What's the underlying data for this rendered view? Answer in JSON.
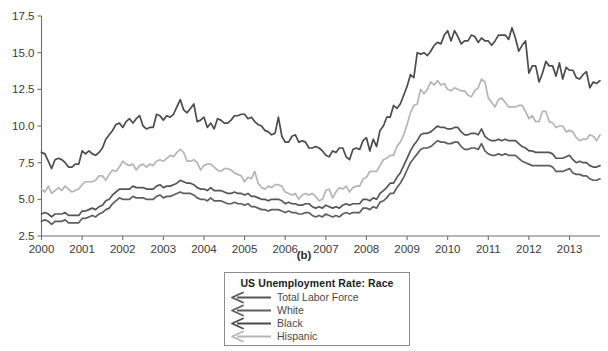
{
  "figure": {
    "panel_label": "(b)"
  },
  "legend": {
    "title": "US Unemployment Rate: Race",
    "marker_icon": "left-arrow-line-icon",
    "entries": [
      {
        "label": "Total Labor Force",
        "color": "#555555"
      },
      {
        "label": "White",
        "color": "#5e5e5e"
      },
      {
        "label": "Black",
        "color": "#4b4b4b"
      },
      {
        "label": "Hispanic",
        "color": "#b5b5b5"
      }
    ]
  },
  "chart_data": {
    "type": "line",
    "title": "US Unemployment Rate: Race",
    "xlabel": "",
    "ylabel": "",
    "xlim": [
      2000.0,
      2013.75
    ],
    "ylim": [
      2.5,
      17.5
    ],
    "grid": false,
    "legend_position": "below-center",
    "xticks": [
      "2000",
      "2001",
      "2002",
      "2003",
      "2004",
      "2005",
      "2006",
      "2007",
      "2008",
      "2009",
      "2010",
      "2011",
      "2012",
      "2013"
    ],
    "xtick_values": [
      2000,
      2001,
      2002,
      2003,
      2004,
      2005,
      2006,
      2007,
      2008,
      2009,
      2010,
      2011,
      2012,
      2013
    ],
    "yticks": [
      "2.5",
      "5.0",
      "7.5",
      "10.0",
      "12.5",
      "15.0",
      "17.5"
    ],
    "ytick_values": [
      2.5,
      5.0,
      7.5,
      10.0,
      12.5,
      15.0,
      17.5
    ],
    "x": [
      2000.0,
      2000.083,
      2000.167,
      2000.25,
      2000.333,
      2000.417,
      2000.5,
      2000.583,
      2000.667,
      2000.75,
      2000.833,
      2000.917,
      2001.0,
      2001.083,
      2001.167,
      2001.25,
      2001.333,
      2001.417,
      2001.5,
      2001.583,
      2001.667,
      2001.75,
      2001.833,
      2001.917,
      2002.0,
      2002.083,
      2002.167,
      2002.25,
      2002.333,
      2002.417,
      2002.5,
      2002.583,
      2002.667,
      2002.75,
      2002.833,
      2002.917,
      2003.0,
      2003.083,
      2003.167,
      2003.25,
      2003.333,
      2003.417,
      2003.5,
      2003.583,
      2003.667,
      2003.75,
      2003.833,
      2003.917,
      2004.0,
      2004.083,
      2004.167,
      2004.25,
      2004.333,
      2004.417,
      2004.5,
      2004.583,
      2004.667,
      2004.75,
      2004.833,
      2004.917,
      2005.0,
      2005.083,
      2005.167,
      2005.25,
      2005.333,
      2005.417,
      2005.5,
      2005.583,
      2005.667,
      2005.75,
      2005.833,
      2005.917,
      2006.0,
      2006.083,
      2006.167,
      2006.25,
      2006.333,
      2006.417,
      2006.5,
      2006.583,
      2006.667,
      2006.75,
      2006.833,
      2006.917,
      2007.0,
      2007.083,
      2007.167,
      2007.25,
      2007.333,
      2007.417,
      2007.5,
      2007.583,
      2007.667,
      2007.75,
      2007.833,
      2007.917,
      2008.0,
      2008.083,
      2008.167,
      2008.25,
      2008.333,
      2008.417,
      2008.5,
      2008.583,
      2008.667,
      2008.75,
      2008.833,
      2008.917,
      2009.0,
      2009.083,
      2009.167,
      2009.25,
      2009.333,
      2009.417,
      2009.5,
      2009.583,
      2009.667,
      2009.75,
      2009.833,
      2009.917,
      2010.0,
      2010.083,
      2010.167,
      2010.25,
      2010.333,
      2010.417,
      2010.5,
      2010.583,
      2010.667,
      2010.75,
      2010.833,
      2010.917,
      2011.0,
      2011.083,
      2011.167,
      2011.25,
      2011.333,
      2011.417,
      2011.5,
      2011.583,
      2011.667,
      2011.75,
      2011.833,
      2011.917,
      2012.0,
      2012.083,
      2012.167,
      2012.25,
      2012.333,
      2012.417,
      2012.5,
      2012.583,
      2012.667,
      2012.75,
      2012.833,
      2012.917,
      2013.0,
      2013.083,
      2013.167,
      2013.25,
      2013.333,
      2013.417,
      2013.5,
      2013.583,
      2013.667,
      2013.75
    ],
    "series": [
      {
        "name": "Black",
        "color": "#4b4b4b",
        "values": [
          8.2,
          8.1,
          7.6,
          7.1,
          7.7,
          7.8,
          7.7,
          7.5,
          7.2,
          7.2,
          7.4,
          7.4,
          8.3,
          8.1,
          8.3,
          8.1,
          8.0,
          8.2,
          8.5,
          9.1,
          9.4,
          9.7,
          10.1,
          10.2,
          9.9,
          10.3,
          10.5,
          10.2,
          10.5,
          10.7,
          10.0,
          9.8,
          9.9,
          9.9,
          10.8,
          10.7,
          10.4,
          10.7,
          10.6,
          10.8,
          11.3,
          11.8,
          11.1,
          10.9,
          11.2,
          11.5,
          10.3,
          10.4,
          10.6,
          9.9,
          10.2,
          9.8,
          10.5,
          10.4,
          10.2,
          10.2,
          10.4,
          10.7,
          10.7,
          10.8,
          10.8,
          10.5,
          10.6,
          10.3,
          10.1,
          10.0,
          9.7,
          9.6,
          9.4,
          9.5,
          10.6,
          9.3,
          8.9,
          8.9,
          9.3,
          9.4,
          8.9,
          9.0,
          8.9,
          8.5,
          8.5,
          8.6,
          8.5,
          8.3,
          8.0,
          7.9,
          8.3,
          8.2,
          8.5,
          8.5,
          7.9,
          7.7,
          8.4,
          8.5,
          8.4,
          9.0,
          9.2,
          8.3,
          9.1,
          8.6,
          9.7,
          10.0,
          10.6,
          10.6,
          11.4,
          11.2,
          11.5,
          12.1,
          12.7,
          13.5,
          13.3,
          15.0,
          14.9,
          15.0,
          14.8,
          15.1,
          15.5,
          15.7,
          15.6,
          16.2,
          16.5,
          15.8,
          16.5,
          16.1,
          15.6,
          15.8,
          15.8,
          16.2,
          16.1,
          15.7,
          16.0,
          15.8,
          15.8,
          15.5,
          15.8,
          16.2,
          16.2,
          16.2,
          15.9,
          16.7,
          16.0,
          15.1,
          15.5,
          15.8,
          13.6,
          14.1,
          14.1,
          13.0,
          13.6,
          14.4,
          14.1,
          14.1,
          13.4,
          14.3,
          13.2,
          14.0,
          13.8,
          13.8,
          13.3,
          13.2,
          13.5,
          13.7,
          12.6,
          13.0,
          12.9,
          13.1
        ]
      },
      {
        "name": "Hispanic",
        "color": "#b5b5b5",
        "values": [
          5.7,
          5.5,
          5.9,
          5.4,
          5.6,
          5.8,
          5.6,
          5.9,
          5.7,
          5.5,
          5.6,
          5.7,
          6.0,
          6.2,
          6.2,
          6.2,
          6.3,
          6.6,
          6.6,
          6.3,
          6.7,
          7.0,
          6.9,
          7.2,
          7.6,
          7.4,
          7.3,
          7.4,
          7.0,
          7.3,
          7.4,
          7.2,
          7.4,
          7.3,
          7.6,
          7.7,
          7.6,
          7.8,
          8.0,
          7.9,
          8.2,
          8.4,
          8.2,
          7.6,
          7.6,
          7.7,
          7.5,
          7.0,
          7.3,
          7.4,
          7.4,
          7.2,
          7.0,
          6.9,
          7.1,
          7.1,
          7.0,
          6.8,
          6.7,
          6.6,
          6.2,
          6.5,
          6.4,
          6.9,
          6.1,
          5.8,
          5.7,
          5.9,
          5.8,
          6.0,
          6.0,
          5.9,
          5.5,
          5.4,
          5.3,
          5.4,
          5.0,
          5.3,
          5.4,
          5.3,
          5.4,
          5.2,
          4.9,
          5.0,
          5.6,
          5.7,
          5.1,
          5.5,
          5.8,
          5.7,
          5.9,
          5.5,
          5.8,
          5.9,
          5.9,
          6.4,
          6.5,
          6.9,
          6.9,
          6.9,
          7.3,
          7.7,
          7.8,
          8.0,
          8.0,
          8.6,
          8.9,
          9.4,
          10.1,
          10.9,
          11.4,
          11.5,
          12.5,
          12.2,
          12.5,
          13.0,
          12.8,
          13.1,
          12.8,
          12.9,
          12.5,
          12.4,
          12.6,
          12.5,
          12.4,
          12.4,
          12.1,
          12.0,
          12.4,
          12.6,
          13.2,
          13.0,
          11.9,
          11.6,
          11.3,
          11.8,
          11.9,
          11.6,
          11.3,
          11.3,
          11.3,
          11.4,
          11.4,
          11.0,
          10.5,
          10.7,
          10.3,
          10.3,
          11.0,
          11.0,
          10.3,
          10.2,
          9.9,
          10.0,
          10.0,
          9.6,
          9.7,
          9.6,
          9.2,
          9.0,
          9.1,
          9.1,
          9.4,
          9.3,
          9.0,
          9.4
        ]
      },
      {
        "name": "Total Labor Force",
        "color": "#555555",
        "values": [
          4.0,
          4.1,
          4.0,
          3.8,
          4.0,
          4.0,
          4.0,
          4.1,
          3.9,
          3.9,
          3.9,
          3.9,
          4.2,
          4.2,
          4.3,
          4.4,
          4.3,
          4.5,
          4.6,
          4.9,
          5.0,
          5.3,
          5.5,
          5.7,
          5.7,
          5.7,
          5.7,
          5.9,
          5.8,
          5.8,
          5.8,
          5.7,
          5.7,
          5.7,
          5.9,
          6.0,
          5.8,
          5.9,
          5.9,
          6.0,
          6.1,
          6.3,
          6.2,
          6.1,
          6.1,
          6.0,
          5.8,
          5.7,
          5.7,
          5.6,
          5.8,
          5.6,
          5.6,
          5.6,
          5.5,
          5.4,
          5.4,
          5.5,
          5.4,
          5.4,
          5.3,
          5.4,
          5.2,
          5.2,
          5.1,
          5.0,
          5.0,
          4.9,
          5.0,
          5.0,
          5.0,
          4.9,
          4.7,
          4.8,
          4.7,
          4.7,
          4.6,
          4.6,
          4.7,
          4.7,
          4.5,
          4.4,
          4.5,
          4.4,
          4.6,
          4.5,
          4.4,
          4.5,
          4.4,
          4.6,
          4.7,
          4.6,
          4.7,
          4.7,
          4.7,
          5.0,
          5.0,
          4.9,
          5.1,
          5.0,
          5.4,
          5.6,
          5.8,
          6.1,
          6.1,
          6.5,
          6.8,
          7.3,
          7.8,
          8.3,
          8.7,
          9.0,
          9.4,
          9.5,
          9.5,
          9.6,
          9.8,
          10.0,
          9.9,
          9.9,
          9.8,
          9.8,
          9.9,
          9.9,
          9.6,
          9.4,
          9.4,
          9.5,
          9.5,
          9.4,
          9.8,
          9.3,
          9.1,
          9.0,
          9.0,
          9.1,
          9.0,
          9.1,
          9.0,
          9.0,
          9.0,
          8.8,
          8.6,
          8.5,
          8.3,
          8.3,
          8.2,
          8.2,
          8.2,
          8.2,
          8.2,
          8.1,
          7.8,
          7.8,
          7.8,
          7.9,
          8.0,
          7.7,
          7.5,
          7.6,
          7.5,
          7.5,
          7.3,
          7.2,
          7.2,
          7.3
        ]
      },
      {
        "name": "White",
        "color": "#5e5e5e",
        "values": [
          3.5,
          3.6,
          3.5,
          3.3,
          3.5,
          3.5,
          3.5,
          3.6,
          3.4,
          3.4,
          3.4,
          3.4,
          3.7,
          3.7,
          3.8,
          3.9,
          3.8,
          4.0,
          4.1,
          4.3,
          4.4,
          4.7,
          4.9,
          5.1,
          5.0,
          5.0,
          5.0,
          5.2,
          5.1,
          5.1,
          5.1,
          5.0,
          5.0,
          5.0,
          5.2,
          5.3,
          5.1,
          5.2,
          5.2,
          5.3,
          5.4,
          5.5,
          5.4,
          5.4,
          5.4,
          5.3,
          5.1,
          5.0,
          5.0,
          4.9,
          5.1,
          4.9,
          4.9,
          4.9,
          4.8,
          4.7,
          4.7,
          4.8,
          4.7,
          4.7,
          4.6,
          4.7,
          4.5,
          4.5,
          4.4,
          4.3,
          4.3,
          4.2,
          4.3,
          4.3,
          4.3,
          4.2,
          4.1,
          4.2,
          4.1,
          4.1,
          4.0,
          4.0,
          4.1,
          4.1,
          3.9,
          3.8,
          3.9,
          3.8,
          4.0,
          3.9,
          3.8,
          3.9,
          3.8,
          4.0,
          4.1,
          4.0,
          4.1,
          4.1,
          4.1,
          4.4,
          4.4,
          4.3,
          4.5,
          4.4,
          4.8,
          4.9,
          5.1,
          5.4,
          5.4,
          5.8,
          6.1,
          6.5,
          7.0,
          7.5,
          7.8,
          8.1,
          8.4,
          8.5,
          8.5,
          8.6,
          8.8,
          9.0,
          8.9,
          8.9,
          8.8,
          8.8,
          8.9,
          8.9,
          8.6,
          8.4,
          8.4,
          8.5,
          8.5,
          8.4,
          8.8,
          8.3,
          8.1,
          8.0,
          8.0,
          8.1,
          8.0,
          8.1,
          8.0,
          8.0,
          8.0,
          7.8,
          7.6,
          7.5,
          7.4,
          7.3,
          7.3,
          7.3,
          7.3,
          7.3,
          7.3,
          7.2,
          6.9,
          6.9,
          6.9,
          7.0,
          7.1,
          6.8,
          6.7,
          6.7,
          6.6,
          6.6,
          6.4,
          6.3,
          6.3,
          6.4
        ]
      }
    ]
  }
}
